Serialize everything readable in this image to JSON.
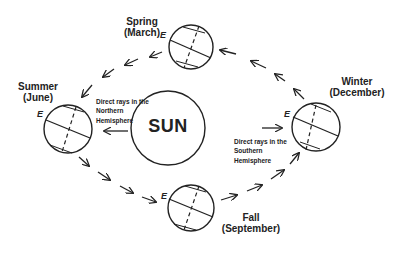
{
  "diagram": {
    "center": {
      "label": "SUN"
    },
    "seasons": [
      {
        "id": "spring",
        "name": "Spring",
        "month": "(March)",
        "marker": "E"
      },
      {
        "id": "summer",
        "name": "Summer",
        "month": "(June)",
        "marker": "E"
      },
      {
        "id": "fall",
        "name": "Fall",
        "month": "(September)",
        "marker": "E"
      },
      {
        "id": "winter",
        "name": "Winter",
        "month": "(December)",
        "marker": "E"
      }
    ],
    "annotations": {
      "northern": [
        "Direct rays in the",
        "Northern",
        "Hemisphere"
      ],
      "southern": [
        "Direct rays in the",
        "Southern",
        "Hemisphere"
      ]
    },
    "orbit_direction": "counterclockwise (Spring → Summer → Fall → Winter → Spring)",
    "colors": {
      "line": "#222222",
      "background": "#ffffff"
    }
  }
}
